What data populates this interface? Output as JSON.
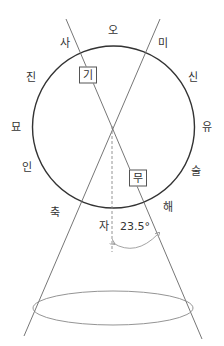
{
  "diagram": {
    "circle_labels": [
      {
        "id": "o",
        "text": "오",
        "x": 113,
        "y": 30
      },
      {
        "id": "mi",
        "text": "미",
        "x": 163,
        "y": 43
      },
      {
        "id": "sin",
        "text": "신",
        "x": 193,
        "y": 77
      },
      {
        "id": "yu",
        "text": "유",
        "x": 207,
        "y": 127
      },
      {
        "id": "sul",
        "text": "술",
        "x": 196,
        "y": 171
      },
      {
        "id": "hae",
        "text": "해",
        "x": 168,
        "y": 207
      },
      {
        "id": "ja",
        "text": "자",
        "x": 104,
        "y": 226
      },
      {
        "id": "chuk",
        "text": "축",
        "x": 55,
        "y": 212
      },
      {
        "id": "in",
        "text": "인",
        "x": 27,
        "y": 167
      },
      {
        "id": "myo",
        "text": "묘",
        "x": 16,
        "y": 127
      },
      {
        "id": "jin",
        "text": "진",
        "x": 31,
        "y": 77
      },
      {
        "id": "sa",
        "text": "사",
        "x": 65,
        "y": 43
      }
    ],
    "boxed_labels": [
      {
        "id": "gi",
        "text": "기",
        "x": 88,
        "y": 75
      },
      {
        "id": "mu",
        "text": "무",
        "x": 138,
        "y": 178
      }
    ],
    "angle_label": {
      "text": "23.5°",
      "x": 135,
      "y": 226
    },
    "geometry": {
      "circle": {
        "cx": 113.5,
        "cy": 127,
        "r": 81
      },
      "apex": {
        "x": 112,
        "y": 126
      },
      "line_a": {
        "x1": 66,
        "y1": 19,
        "x2": 202,
        "y2": 339
      },
      "line_b": {
        "x1": 160,
        "y1": 19,
        "x2": 24,
        "y2": 336
      },
      "axis_dashed": {
        "x1": 112,
        "y1": 126,
        "x2": 112,
        "y2": 252
      },
      "ellipse": {
        "cx": 113,
        "cy": 308,
        "rx": 80,
        "ry": 17
      },
      "arc": {
        "x1": 113,
        "y1": 243,
        "x2": 158,
        "y2": 234
      }
    },
    "colors": {
      "circle": "#333333",
      "lines": "#666666",
      "ellipse": "#888888",
      "arc": "#999999",
      "text": "#333333"
    }
  }
}
